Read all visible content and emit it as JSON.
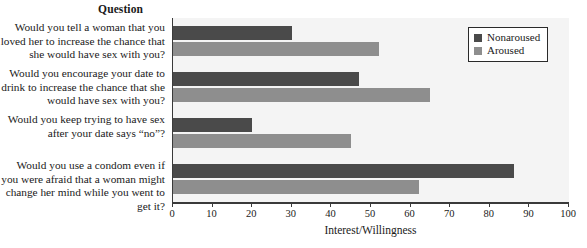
{
  "header": {
    "question_column_title": "Question"
  },
  "legend": {
    "position": "top-right",
    "items": [
      {
        "label": "Nonaroused",
        "color": "#4a4a4a",
        "swatch_name": "legend-swatch-nonaroused"
      },
      {
        "label": "Aroused",
        "color": "#8e8e8e",
        "swatch_name": "legend-swatch-aroused"
      }
    ]
  },
  "chart_data": {
    "type": "bar",
    "orientation": "horizontal",
    "title": "",
    "xlabel": "Interest/Willingness",
    "ylabel": "Question",
    "xlim": [
      0,
      100
    ],
    "xticks": [
      0,
      10,
      20,
      30,
      40,
      50,
      60,
      70,
      80,
      90,
      100
    ],
    "grid": false,
    "categories": [
      "Would you tell a woman that you loved her to increase the chance that she would have sex with you?",
      "Would you encourage your date to drink to increase the chance that she would have sex with you?",
      "Would you keep trying to have sex after your date says “no”?",
      "Would you use a condom even if you were afraid that a woman might change her mind while you went to get it?"
    ],
    "series": [
      {
        "name": "Nonaroused",
        "color": "#4a4a4a",
        "values": [
          30,
          47,
          20,
          86
        ]
      },
      {
        "name": "Aroused",
        "color": "#8e8e8e",
        "values": [
          52,
          65,
          45,
          62
        ]
      }
    ]
  }
}
